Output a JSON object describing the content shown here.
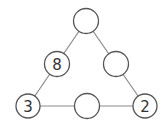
{
  "diagram": {
    "type": "number-triangle-puzzle",
    "nodes": [
      {
        "id": "top",
        "label": "",
        "cx": 86,
        "cy": 21
      },
      {
        "id": "left-mid",
        "label": "8",
        "cx": 57,
        "cy": 64
      },
      {
        "id": "right-mid",
        "label": "",
        "cx": 116,
        "cy": 64
      },
      {
        "id": "bottom-left",
        "label": "3",
        "cx": 28,
        "cy": 106
      },
      {
        "id": "bottom-mid",
        "label": "",
        "cx": 87,
        "cy": 106
      },
      {
        "id": "bottom-right",
        "label": "2",
        "cx": 145,
        "cy": 106
      }
    ],
    "colors": {
      "stroke": "#555555",
      "line": "#888888",
      "text": "#333333"
    }
  }
}
